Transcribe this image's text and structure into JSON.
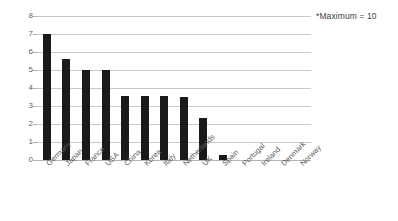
{
  "chart_data": {
    "type": "bar",
    "title": "",
    "xlabel": "",
    "ylabel": "",
    "ylim": [
      0,
      8
    ],
    "yticks": [
      "0",
      "1",
      "2",
      "3",
      "4",
      "5",
      "6",
      "7",
      "8"
    ],
    "grid": true,
    "legend": "none",
    "bar_color": "#1a1a1a",
    "gridline_color": "#c9c9c9",
    "categories": [
      "Germany",
      "Japan",
      "France",
      "USA",
      "China",
      "Korea",
      "Italy",
      "Netherlands",
      "UK",
      "Spain",
      "Portugal",
      "Ireland",
      "Denmark",
      "Norway"
    ],
    "values": [
      7.0,
      5.6,
      5.0,
      5.0,
      3.55,
      3.55,
      3.55,
      3.5,
      2.35,
      0.3,
      0,
      0,
      0,
      0
    ],
    "annotations": [
      {
        "text": "*Maximum = 10",
        "position": "top-right"
      }
    ]
  },
  "annotation": {
    "maximum_note": "*Maximum = 10"
  }
}
